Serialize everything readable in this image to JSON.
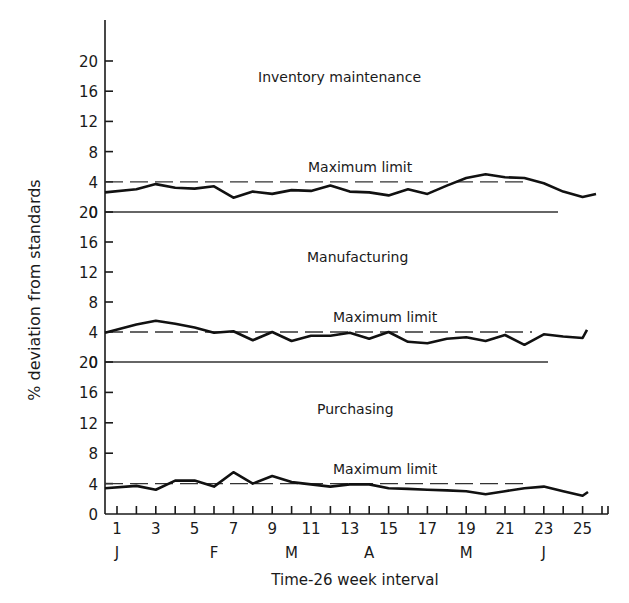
{
  "chart_data": {
    "type": "line",
    "ylabel": "% deviation from standards",
    "xlabel": "Time-26 week interval",
    "x": [
      1,
      2,
      3,
      4,
      5,
      6,
      7,
      8,
      9,
      10,
      11,
      12,
      13,
      14,
      15,
      16,
      17,
      18,
      19,
      20,
      21,
      22,
      23,
      24,
      25,
      26
    ],
    "x_tick_labels": [
      "1",
      "3",
      "5",
      "7",
      "9",
      "11",
      "13",
      "15",
      "17",
      "19",
      "21",
      "23",
      "25"
    ],
    "month_labels": [
      {
        "label": "J",
        "week": 1
      },
      {
        "label": "F",
        "week": 6
      },
      {
        "label": "M",
        "week": 10
      },
      {
        "label": "A",
        "week": 14
      },
      {
        "label": "M",
        "week": 19
      },
      {
        "label": "J",
        "week": 23
      }
    ],
    "panels": [
      {
        "title": "Inventory maintenance",
        "limit_label": "Maximum limit",
        "max_limit": 4,
        "ylim": [
          0,
          20
        ],
        "y_ticks": [
          0,
          4,
          8,
          12,
          16,
          20
        ],
        "values": [
          2.6,
          3.0,
          3.7,
          3.2,
          3.1,
          3.4,
          1.9,
          2.7,
          2.4,
          2.9,
          2.8,
          3.5,
          2.7,
          2.6,
          2.2,
          3.0,
          2.4,
          3.5,
          4.5,
          5.0,
          4.6,
          4.5,
          3.8,
          2.7,
          2.0,
          2.4
        ]
      },
      {
        "title": "Manufacturing",
        "limit_label": "Maximum limit",
        "max_limit": 4,
        "ylim": [
          0,
          20
        ],
        "y_ticks": [
          0,
          4,
          8,
          12,
          16,
          20
        ],
        "values": [
          3.9,
          5.0,
          5.5,
          5.1,
          4.6,
          3.9,
          4.1,
          2.9,
          4.0,
          2.8,
          3.5,
          3.5,
          3.9,
          3.1,
          4.0,
          2.7,
          2.5,
          3.1,
          3.3,
          2.8,
          3.6,
          2.3,
          3.7,
          3.4,
          3.2,
          4.3
        ]
      },
      {
        "title": "Purchasing",
        "limit_label": "Maximum limit",
        "max_limit": 4,
        "ylim": [
          0,
          20
        ],
        "y_ticks": [
          0,
          4,
          8,
          12,
          16,
          20
        ],
        "values": [
          3.4,
          3.7,
          3.2,
          4.4,
          4.4,
          3.6,
          5.5,
          4.0,
          5.0,
          4.2,
          3.9,
          3.6,
          3.9,
          3.9,
          3.4,
          3.3,
          3.2,
          3.1,
          3.0,
          2.6,
          3.0,
          3.4,
          3.6,
          3.0,
          2.4,
          2.9
        ]
      }
    ],
    "grid": false,
    "legend": "none"
  }
}
